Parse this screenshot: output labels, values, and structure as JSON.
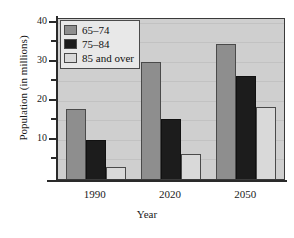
{
  "chart_data": {
    "type": "bar",
    "title": "",
    "xlabel": "Year",
    "ylabel": "Population (in millions)",
    "categories": [
      "1990",
      "2020",
      "2050"
    ],
    "series": [
      {
        "name": "65–74",
        "color": "#8e8e8e",
        "values": [
          18,
          30,
          34.5
        ]
      },
      {
        "name": "75–84",
        "color": "#1c1c1c",
        "values": [
          10,
          15.5,
          26.5
        ]
      },
      {
        "name": "85 and over",
        "color": "#d9d9d9",
        "values": [
          3,
          6.5,
          18.5
        ]
      }
    ],
    "ylim": [
      0,
      41
    ],
    "yticks_major": [
      10,
      20,
      30,
      40
    ],
    "yticks_minor": [
      5,
      15,
      25,
      35
    ],
    "ytick_labels": [
      "10",
      "20",
      "30",
      "40"
    ],
    "grid": true,
    "legend_position": "top-left",
    "plot_background": "#cfcfcf",
    "axis_color": "#2a2a2a"
  }
}
